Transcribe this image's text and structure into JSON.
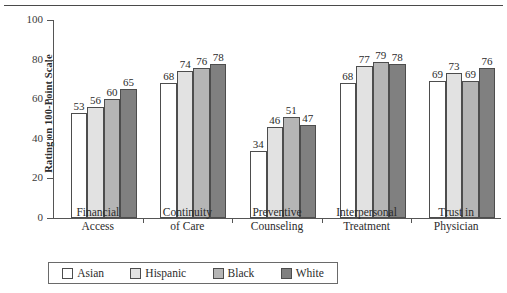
{
  "chart_data": {
    "type": "bar",
    "title": "",
    "xlabel": "",
    "ylabel": "Rating on 100-Point Scale",
    "ylim": [
      0,
      100
    ],
    "yticks": [
      0,
      20,
      40,
      60,
      80,
      100
    ],
    "grid": false,
    "legend_position": "bottom",
    "categories": [
      "Financial Access",
      "Continuity of Care",
      "Preventive Counseling",
      "Interpersonal Treatment",
      "Trust in Physician"
    ],
    "category_lines": [
      [
        "Financial",
        "Access"
      ],
      [
        "Continuity",
        "of Care"
      ],
      [
        "Preventive",
        "Counseling"
      ],
      [
        "Interpersonal",
        "Treatment"
      ],
      [
        "Trust in",
        "Physician"
      ]
    ],
    "series": [
      {
        "name": "Asian",
        "color": "#ffffff",
        "values": [
          53,
          68,
          34,
          68,
          69
        ]
      },
      {
        "name": "Hispanic",
        "color": "#e2e2e2",
        "values": [
          56,
          74,
          46,
          77,
          73
        ]
      },
      {
        "name": "Black",
        "color": "#b5b5b5",
        "values": [
          60,
          76,
          51,
          79,
          69
        ]
      },
      {
        "name": "White",
        "color": "#808080",
        "values": [
          65,
          78,
          47,
          78,
          76
        ]
      }
    ]
  },
  "legend": {
    "items": [
      {
        "label": "Asian",
        "color": "#ffffff"
      },
      {
        "label": "Hispanic",
        "color": "#e2e2e2"
      },
      {
        "label": "Black",
        "color": "#b5b5b5"
      },
      {
        "label": "White",
        "color": "#808080"
      }
    ]
  }
}
